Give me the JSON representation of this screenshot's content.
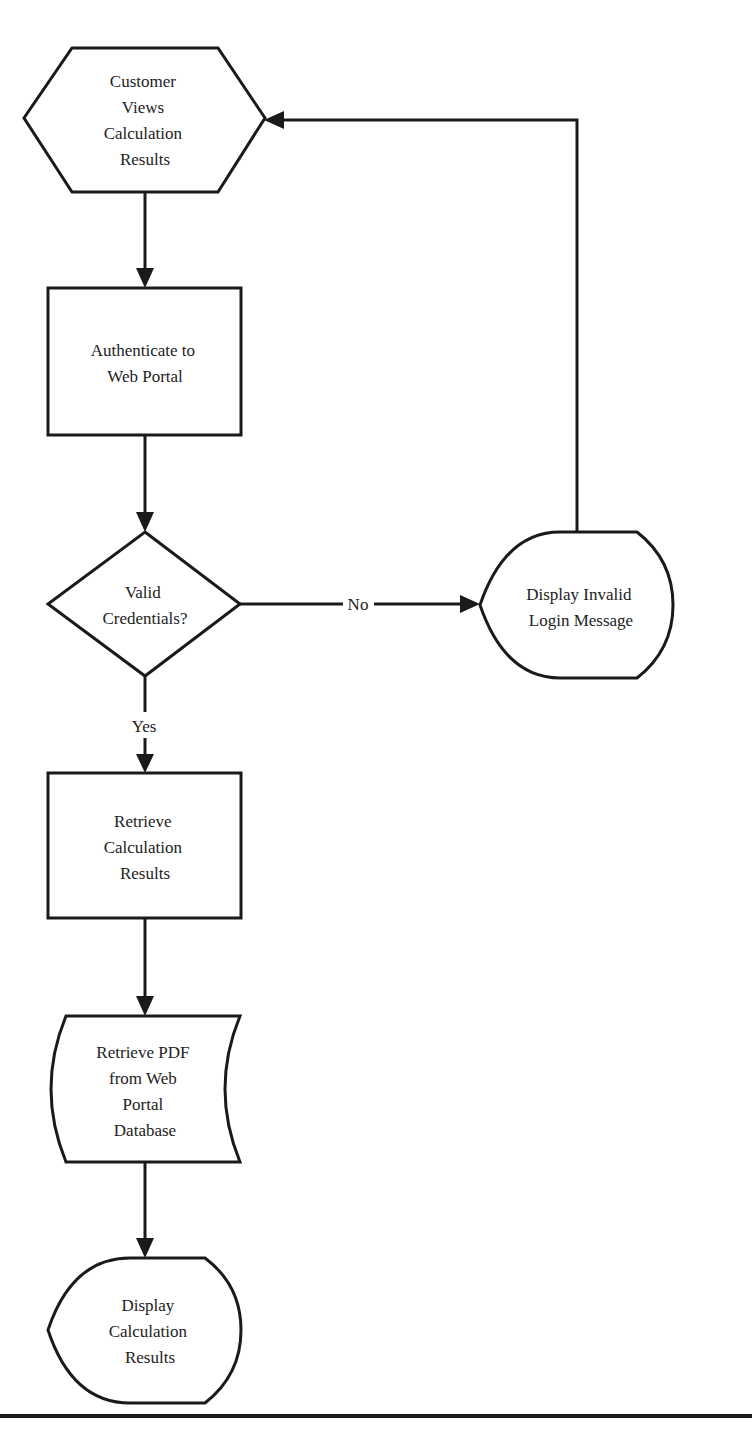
{
  "diagram": {
    "type": "flowchart",
    "nodes": [
      {
        "id": "start",
        "shape": "hexagon",
        "lines": [
          "Customer",
          "Views",
          "Calculation",
          "Results"
        ]
      },
      {
        "id": "authenticate",
        "shape": "process",
        "lines": [
          "Authenticate to",
          "Web Portal"
        ]
      },
      {
        "id": "valid",
        "shape": "decision",
        "lines": [
          "Valid",
          "Credentials?"
        ]
      },
      {
        "id": "invalid",
        "shape": "display",
        "lines": [
          "Display Invalid",
          "Login Message"
        ]
      },
      {
        "id": "retrieve",
        "shape": "process",
        "lines": [
          "Retrieve",
          "Calculation",
          "Results"
        ]
      },
      {
        "id": "pdf",
        "shape": "stored-data",
        "lines": [
          "Retrieve PDF",
          "from Web",
          "Portal",
          "Database"
        ]
      },
      {
        "id": "display",
        "shape": "display",
        "lines": [
          "Display",
          "Calculation",
          "Results"
        ]
      }
    ],
    "edges": [
      {
        "from": "start",
        "to": "authenticate",
        "label": ""
      },
      {
        "from": "authenticate",
        "to": "valid",
        "label": ""
      },
      {
        "from": "valid",
        "to": "invalid",
        "label": "No"
      },
      {
        "from": "invalid",
        "to": "start",
        "label": ""
      },
      {
        "from": "valid",
        "to": "retrieve",
        "label": "Yes"
      },
      {
        "from": "retrieve",
        "to": "pdf",
        "label": ""
      },
      {
        "from": "pdf",
        "to": "display",
        "label": ""
      }
    ]
  },
  "colors": {
    "stroke": "#1a1a1a",
    "text": "#222222",
    "background": "#ffffff"
  }
}
